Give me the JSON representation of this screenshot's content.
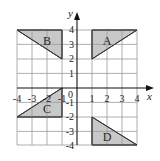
{
  "diagram": {
    "type": "coordinate-grid",
    "x_axis": {
      "label": "x",
      "min": -4,
      "max": 4,
      "ticks": [
        "-4",
        "-3",
        "-2",
        "-1",
        "1",
        "2",
        "3",
        "4"
      ]
    },
    "y_axis": {
      "label": "y",
      "min": -4,
      "max": 4,
      "ticks": [
        "4",
        "3",
        "2",
        "1",
        "-1",
        "-2",
        "-3",
        "-4"
      ]
    },
    "origin_label": "0",
    "shape_fill": "#c8c8c8",
    "grid_color": "#9a9a9a",
    "shapes": [
      {
        "name": "A",
        "vertices": [
          [
            1,
            4
          ],
          [
            4,
            4
          ],
          [
            1,
            2
          ]
        ]
      },
      {
        "name": "B",
        "vertices": [
          [
            -4,
            4
          ],
          [
            -1,
            4
          ],
          [
            -1,
            2
          ]
        ]
      },
      {
        "name": "C",
        "vertices": [
          [
            -1,
            0
          ],
          [
            -1,
            -2
          ],
          [
            -4,
            -2
          ]
        ]
      },
      {
        "name": "D",
        "vertices": [
          [
            1,
            -2
          ],
          [
            1,
            -4
          ],
          [
            4,
            -4
          ]
        ]
      }
    ]
  }
}
